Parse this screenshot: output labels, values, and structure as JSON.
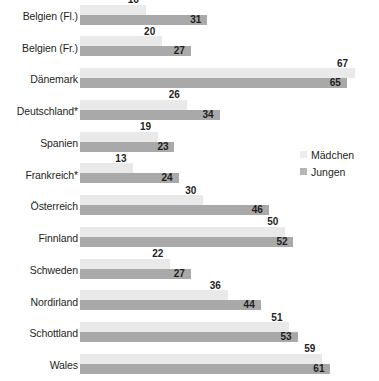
{
  "chart_data": {
    "type": "bar",
    "title": "",
    "subtitle": "",
    "xlabel": "",
    "ylabel": "",
    "orientation": "horizontal",
    "grid": false,
    "legend_position": "middle-right",
    "xlim": [
      0,
      70
    ],
    "categories": [
      "Belgien (Fl.)",
      "Belgien (Fr.)",
      "Dänemark",
      "Deutschland*",
      "Spanien",
      "Frankreich*",
      "Österreich",
      "Finnland",
      "Schweden",
      "Nordirland",
      "Schottland",
      "Wales"
    ],
    "series": [
      {
        "name": "Mädchen",
        "color": "#e9e9e9",
        "values": [
          16,
          20,
          67,
          26,
          19,
          13,
          30,
          50,
          22,
          36,
          51,
          59
        ]
      },
      {
        "name": "Jungen",
        "color": "#a9a9a9",
        "values": [
          31,
          27,
          65,
          34,
          23,
          24,
          46,
          52,
          27,
          44,
          53,
          61
        ]
      }
    ]
  },
  "legend": {
    "items": [
      {
        "label": "Mädchen",
        "swatch": "legend-swatch-girls"
      },
      {
        "label": "Jungen",
        "swatch": "legend-swatch-boys"
      }
    ]
  }
}
